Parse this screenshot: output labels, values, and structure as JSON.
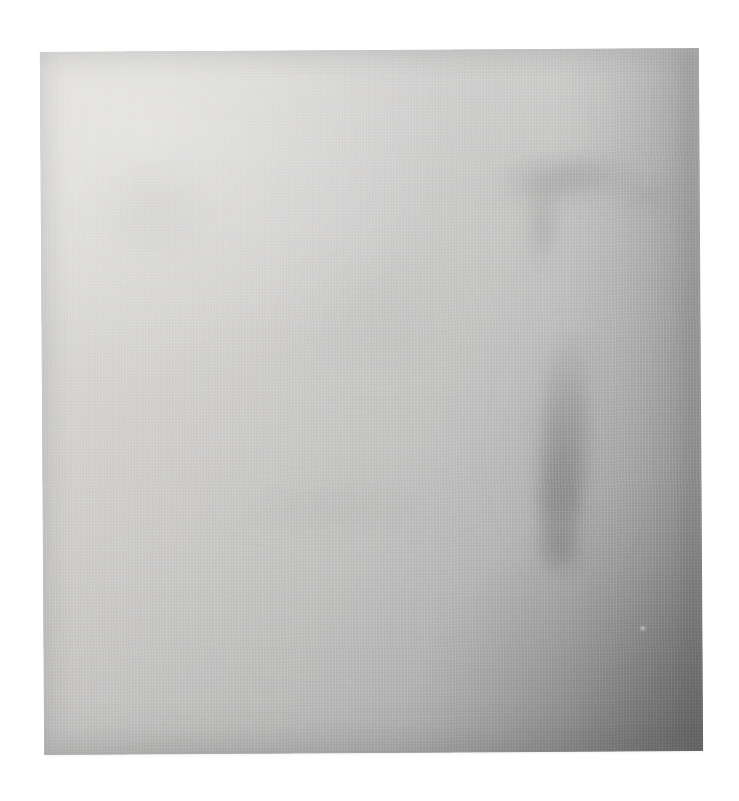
{
  "image": {
    "title": "Blank textured sheet",
    "subject": "near-blank light gray woven paper sheet photographed on a white background",
    "canvas": {
      "width": 739,
      "height": 801
    },
    "background_color": "#ffffff",
    "caption": "Photograph of a blank, lightly soiled woven paper sheet on a white backdrop"
  },
  "sheet": {
    "name": "textured-sheet",
    "surface": "woven paper / canvas",
    "base_color": "#c9c9c7",
    "lightest_color": "#dedcd9",
    "darkest_color": "#8a8a8a",
    "rotation_degrees": -0.35,
    "bounds": {
      "left": 42,
      "top": 50,
      "width": 659,
      "height": 703
    },
    "lighting": "diffuse light from upper-left, shadow pooling toward the lower-right corner"
  },
  "marks": [
    {
      "name": "tee-shaped-smudge",
      "description": "blurred dark horizontal bar with a short descending stem, resembling a letter T",
      "region": "upper right",
      "intensity": "faint"
    },
    {
      "name": "vertical-streak",
      "description": "long soft vertical smudge running down the right-of-centre area",
      "region": "middle right",
      "intensity": "moderate"
    },
    {
      "name": "horizontal-band",
      "description": "very faint wide horizontal band of shading",
      "region": "lower middle",
      "intensity": "very faint"
    },
    {
      "name": "left-blotch",
      "description": "soft diffuse blotch of shading",
      "region": "upper left",
      "intensity": "very faint"
    },
    {
      "name": "centre-blotch",
      "description": "soft diffuse blotch of shading",
      "region": "centre",
      "intensity": "very faint"
    },
    {
      "name": "corner-shadow",
      "description": "darkest shading gathered in the bottom-right corner",
      "region": "bottom right",
      "intensity": "strong"
    },
    {
      "name": "light-speck",
      "description": "tiny pale fleck on the surface",
      "region": "lower right",
      "intensity": "faint"
    }
  ],
  "text_content": {
    "visible_text": "",
    "note": "no legible text is present in the image"
  }
}
